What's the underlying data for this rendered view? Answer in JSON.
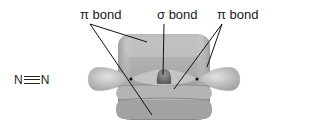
{
  "molecule": {
    "formula_left_atom": "N",
    "formula_right_atom": "N",
    "bond_type": "triple"
  },
  "labels": {
    "pi_left": "π bond",
    "sigma": "σ bond",
    "pi_right": "π bond"
  },
  "colors": {
    "orbital_fill": "#a9a9a9",
    "orbital_light": "#d2d2d2",
    "orbital_dark": "#7a7a7a",
    "sigma_core": "#6e6e6e",
    "leader_line": "#111111"
  }
}
